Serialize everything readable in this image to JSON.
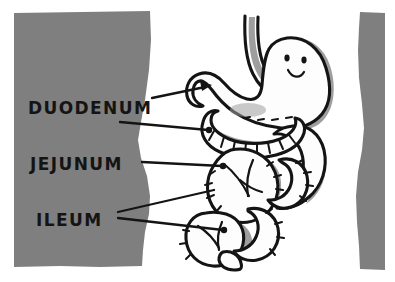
{
  "figure": {
    "style": "hand-drawn cartoon line art",
    "background_color": "#ffffff",
    "panel_color": "#7f7f7f",
    "ink_color": "#141414",
    "shadow_color": "#9e9e9e",
    "organ_fill": "#fdfdfd"
  },
  "panels": {
    "left": {
      "name": "left-gray-panel",
      "color": "#7f7f7f",
      "bounds": {
        "x": 13,
        "y": 11,
        "width": 138,
        "height": 256
      }
    },
    "right": {
      "name": "right-gray-bar",
      "color": "#7f7f7f",
      "bounds": {
        "x": 355,
        "y": 12,
        "width": 30,
        "height": 258
      }
    }
  },
  "labels": [
    {
      "id": "duodenum",
      "text": "DUODENUM",
      "x": 28,
      "y": 114,
      "leader_lines": 1,
      "has_arrow": true,
      "target": "stomach-pylorus"
    },
    {
      "id": "jejunum",
      "text": "JEJUNUM",
      "x": 30,
      "y": 170,
      "leader_lines": 1,
      "has_arrow": false,
      "target": "upper-intestinal-coil"
    },
    {
      "id": "ileum",
      "text": "ILEUM",
      "x": 36,
      "y": 226,
      "leader_lines": 2,
      "has_arrow": false,
      "target": "lower-intestinal-coils"
    }
  ],
  "organs": {
    "esophagus": {
      "name": "esophagus",
      "description": "curved tube entering stomach from top"
    },
    "stomach": {
      "name": "stomach",
      "description": "bean-shaped organ with smiling face",
      "face": {
        "eyes": 2,
        "mouth": "smile"
      }
    },
    "small_intestine": {
      "name": "small-intestine",
      "description": "coiled loops with mesentery hatch marks",
      "segments": [
        "duodenum",
        "jejunum",
        "ileum"
      ]
    }
  }
}
